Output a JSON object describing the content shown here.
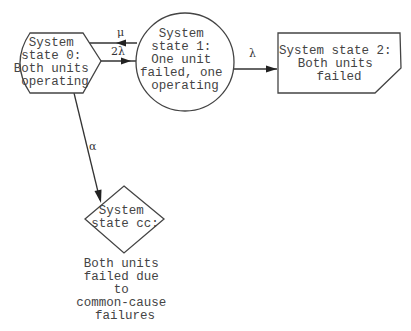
{
  "diagram": {
    "type": "state-transition (Markov) diagram",
    "nodes": [
      {
        "id": "state0",
        "shape": "hexagon-like",
        "lines": [
          "System",
          "state 0:",
          "Both units",
          "operating"
        ]
      },
      {
        "id": "state1",
        "shape": "circle",
        "lines": [
          "System",
          "state 1:",
          "One unit",
          "failed, one",
          "operating"
        ]
      },
      {
        "id": "state2",
        "shape": "clipped-rectangle",
        "lines": [
          "System state 2:",
          "Both units",
          "failed"
        ]
      },
      {
        "id": "statecc",
        "shape": "diamond",
        "lines": [
          "System",
          "state cc:"
        ],
        "caption": [
          "Both units",
          "failed due",
          "to",
          "common-cause",
          "failures"
        ]
      }
    ],
    "edges": [
      {
        "from": "state1",
        "to": "state0",
        "label": "μ"
      },
      {
        "from": "state0",
        "to": "state1",
        "label": "2λ"
      },
      {
        "from": "state1",
        "to": "state2",
        "label": "λ"
      },
      {
        "from": "state0",
        "to": "statecc",
        "label": "α"
      }
    ]
  }
}
